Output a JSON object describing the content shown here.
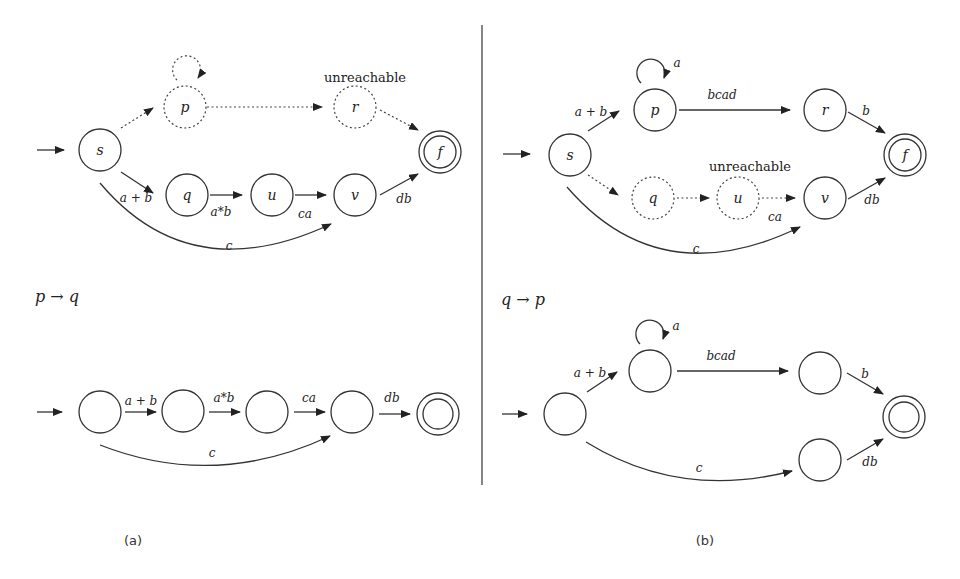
{
  "figure": {
    "divider": {
      "x": 482,
      "y1": 25,
      "y2": 485
    },
    "panels": [
      {
        "id": "a",
        "caption": "(a)",
        "rule_label": "p → q",
        "top_automaton": {
          "states": [
            {
              "id": "s",
              "label": "s",
              "start": true,
              "style": "solid"
            },
            {
              "id": "p",
              "label": "p",
              "style": "dotted"
            },
            {
              "id": "r",
              "label": "r",
              "style": "dotted",
              "annotation": "unreachable"
            },
            {
              "id": "q",
              "label": "q",
              "style": "solid"
            },
            {
              "id": "u",
              "label": "u",
              "style": "solid"
            },
            {
              "id": "v",
              "label": "v",
              "style": "solid"
            },
            {
              "id": "f",
              "label": "f",
              "accepting": true,
              "style": "solid"
            }
          ],
          "transitions": [
            {
              "from": "p",
              "to": "p",
              "label": "",
              "style": "dotted"
            },
            {
              "from": "s",
              "to": "p",
              "label": "",
              "style": "dotted"
            },
            {
              "from": "p",
              "to": "r",
              "label": "",
              "style": "dotted"
            },
            {
              "from": "r",
              "to": "f",
              "label": "",
              "style": "dotted"
            },
            {
              "from": "s",
              "to": "q",
              "label": "a + b",
              "style": "solid"
            },
            {
              "from": "q",
              "to": "u",
              "label": "a*b",
              "style": "solid"
            },
            {
              "from": "u",
              "to": "v",
              "label": "ca",
              "style": "solid"
            },
            {
              "from": "v",
              "to": "f",
              "label": "db",
              "style": "solid"
            },
            {
              "from": "s",
              "to": "v",
              "label": "c",
              "style": "solid"
            }
          ]
        },
        "bottom_automaton": {
          "transitions": [
            {
              "label": "a + b"
            },
            {
              "label": "a*b"
            },
            {
              "label": "ca"
            },
            {
              "label": "db"
            },
            {
              "label": "c"
            }
          ]
        }
      },
      {
        "id": "b",
        "caption": "(b)",
        "rule_label": "q → p",
        "top_automaton": {
          "states": [
            {
              "id": "s",
              "label": "s",
              "start": true,
              "style": "solid"
            },
            {
              "id": "p",
              "label": "p",
              "style": "solid"
            },
            {
              "id": "r",
              "label": "r",
              "style": "solid"
            },
            {
              "id": "q",
              "label": "q",
              "style": "dotted"
            },
            {
              "id": "u",
              "label": "u",
              "style": "dotted",
              "annotation": "unreachable"
            },
            {
              "id": "v",
              "label": "v",
              "style": "solid"
            },
            {
              "id": "f",
              "label": "f",
              "accepting": true,
              "style": "solid"
            }
          ],
          "transitions": [
            {
              "from": "p",
              "to": "p",
              "label": "a",
              "style": "solid"
            },
            {
              "from": "s",
              "to": "p",
              "label": "a + b",
              "style": "solid"
            },
            {
              "from": "p",
              "to": "r",
              "label": "bcad",
              "style": "solid"
            },
            {
              "from": "r",
              "to": "f",
              "label": "b",
              "style": "solid"
            },
            {
              "from": "s",
              "to": "q",
              "label": "",
              "style": "dotted"
            },
            {
              "from": "q",
              "to": "u",
              "label": "",
              "style": "dotted"
            },
            {
              "from": "u",
              "to": "v",
              "label": "ca",
              "style": "dotted"
            },
            {
              "from": "v",
              "to": "f",
              "label": "db",
              "style": "solid"
            },
            {
              "from": "s",
              "to": "v",
              "label": "c",
              "style": "solid"
            }
          ]
        },
        "bottom_automaton": {
          "transitions": [
            {
              "label": "a"
            },
            {
              "label": "a + b"
            },
            {
              "label": "bcad"
            },
            {
              "label": "b"
            },
            {
              "label": "db"
            },
            {
              "label": "c"
            }
          ]
        }
      }
    ],
    "labels": {
      "a_top_unreachable": "unreachable",
      "a_top_s": "s",
      "a_top_p": "p",
      "a_top_r": "r",
      "a_top_q": "q",
      "a_top_u": "u",
      "a_top_v": "v",
      "a_top_f": "f",
      "a_top_ab": "a + b",
      "a_top_astarb": "a*b",
      "a_top_ca": "ca",
      "a_top_db": "db",
      "a_top_c": "c",
      "a_rule": "p → q",
      "a_bot_ab": "a + b",
      "a_bot_astarb": "a*b",
      "a_bot_ca": "ca",
      "a_bot_db": "db",
      "a_bot_c": "c",
      "a_caption": "(a)",
      "b_top_unreachable": "unreachable",
      "b_top_s": "s",
      "b_top_p": "p",
      "b_top_r": "r",
      "b_top_q": "q",
      "b_top_u": "u",
      "b_top_v": "v",
      "b_top_f": "f",
      "b_top_a": "a",
      "b_top_ab": "a + b",
      "b_top_bcad": "bcad",
      "b_top_b": "b",
      "b_top_ca": "ca",
      "b_top_db": "db",
      "b_top_c": "c",
      "b_rule": "q → p",
      "b_bot_a": "a",
      "b_bot_ab": "a + b",
      "b_bot_bcad": "bcad",
      "b_bot_b": "b",
      "b_bot_db": "db",
      "b_bot_c": "c",
      "b_caption": "(b)"
    }
  }
}
